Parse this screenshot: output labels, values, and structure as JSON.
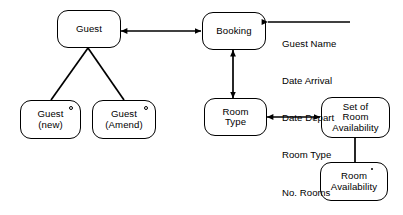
{
  "diagram": {
    "stroke_color": "#000000",
    "background_color": "#ffffff",
    "nodes": [
      {
        "id": "guest",
        "label": "Guest",
        "marker": "none"
      },
      {
        "id": "guest-new",
        "label": "Guest\n(new)",
        "marker": "circle"
      },
      {
        "id": "guest-amend",
        "label": "Guest\n(Amend)",
        "marker": "circle"
      },
      {
        "id": "booking",
        "label": "Booking",
        "marker": "none"
      },
      {
        "id": "room-type",
        "label": "Room\nType",
        "marker": "none"
      },
      {
        "id": "set-of-room-availability",
        "label": "Set of\nRoom\nAvailability",
        "marker": "none"
      },
      {
        "id": "room-availability",
        "label": "Room\nAvailability",
        "marker": "dot"
      }
    ],
    "attributes": {
      "anchor": "booking",
      "items": [
        "Guest Name",
        "Date Arrival",
        "Date Depart",
        "Room Type",
        "No. Rooms"
      ]
    },
    "connections": [
      {
        "from": "guest",
        "to": "booking",
        "style": "double-arrow-horizontal"
      },
      {
        "from": "guest",
        "to": "guest-new",
        "style": "plain-line"
      },
      {
        "from": "guest",
        "to": "guest-amend",
        "style": "plain-line"
      },
      {
        "from": "booking",
        "to": "room-type",
        "style": "double-arrow-vertical"
      },
      {
        "from": "room-type",
        "to": "set-of-room-availability",
        "style": "double-arrow-horizontal"
      },
      {
        "from": "set-of-room-availability",
        "to": "room-availability",
        "style": "plain-line"
      },
      {
        "from": "attributes",
        "to": "booking",
        "style": "single-arrow-left"
      }
    ]
  }
}
